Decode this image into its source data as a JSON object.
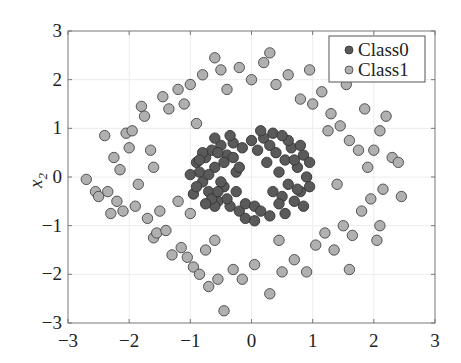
{
  "chart_data": {
    "type": "scatter",
    "title": "",
    "xlabel": "",
    "ylabel": "x2",
    "ylabel_main": "x",
    "ylabel_sub": "2",
    "xlim": [
      -3,
      3
    ],
    "ylim": [
      -3,
      3
    ],
    "xticks": [
      "−3",
      "−2",
      "−1",
      "0",
      "1",
      "2",
      "3"
    ],
    "yticks": [
      "3",
      "2",
      "1",
      "0",
      "−1",
      "−2",
      "−3"
    ],
    "grid": true,
    "legend_position": "upper right",
    "series": [
      {
        "name": "Class0",
        "color": "#5a5a5a",
        "description": "inner ring, radius ~0.5-1.0",
        "points": [
          [
            -0.9,
            0.3
          ],
          [
            -0.85,
            0.1
          ],
          [
            -0.8,
            -0.1
          ],
          [
            -0.75,
            0.4
          ],
          [
            -0.7,
            -0.3
          ],
          [
            -0.65,
            0.55
          ],
          [
            -0.6,
            0.2
          ],
          [
            -0.55,
            -0.5
          ],
          [
            -0.5,
            0.65
          ],
          [
            -0.45,
            -0.2
          ],
          [
            -0.4,
            0.45
          ],
          [
            -0.35,
            -0.6
          ],
          [
            -0.3,
            0.7
          ],
          [
            -0.25,
            0.1
          ],
          [
            -0.2,
            -0.7
          ],
          [
            -0.15,
            0.6
          ],
          [
            -0.1,
            -0.55
          ],
          [
            0.0,
            0.75
          ],
          [
            0.05,
            -0.6
          ],
          [
            0.1,
            0.55
          ],
          [
            0.15,
            -0.7
          ],
          [
            0.2,
            0.8
          ],
          [
            0.3,
            0.65
          ],
          [
            0.35,
            -0.3
          ],
          [
            0.4,
            0.5
          ],
          [
            0.45,
            0.1
          ],
          [
            0.5,
            -0.4
          ],
          [
            0.55,
            0.35
          ],
          [
            0.6,
            -0.15
          ],
          [
            0.65,
            0.6
          ],
          [
            0.7,
            -0.5
          ],
          [
            0.75,
            0.2
          ],
          [
            0.8,
            -0.3
          ],
          [
            0.85,
            0.45
          ],
          [
            0.9,
            0.0
          ],
          [
            0.95,
            -0.2
          ],
          [
            -0.95,
            -0.35
          ],
          [
            -0.8,
            0.5
          ],
          [
            -0.7,
            0.05
          ],
          [
            -0.6,
            -0.6
          ],
          [
            -0.5,
            -0.1
          ],
          [
            -0.45,
            0.3
          ],
          [
            -0.4,
            -0.45
          ],
          [
            -0.3,
            0.4
          ],
          [
            -0.25,
            -0.3
          ],
          [
            -0.2,
            0.2
          ],
          [
            0.25,
            0.3
          ],
          [
            0.35,
            0.9
          ],
          [
            0.45,
            -0.55
          ],
          [
            0.6,
            0.75
          ],
          [
            0.7,
            0.35
          ],
          [
            0.8,
            0.65
          ],
          [
            0.85,
            -0.6
          ],
          [
            -0.6,
            0.8
          ],
          [
            -0.35,
            0.85
          ],
          [
            0.5,
            0.85
          ],
          [
            0.15,
            0.95
          ],
          [
            -0.1,
            -0.85
          ],
          [
            0.3,
            -0.8
          ],
          [
            -0.55,
            0.5
          ],
          [
            -0.65,
            -0.45
          ],
          [
            -0.75,
            -0.55
          ],
          [
            -0.85,
            0.35
          ],
          [
            0.05,
            -0.9
          ],
          [
            0.55,
            -0.75
          ],
          [
            0.75,
            -0.25
          ],
          [
            0.95,
            0.3
          ],
          [
            -1.0,
            0.05
          ],
          [
            -0.9,
            -0.2
          ],
          [
            -0.55,
            -0.3
          ]
        ]
      },
      {
        "name": "Class1",
        "color": "#b0b0b0",
        "description": "outer ring, radius ~1.6-2.6",
        "points": [
          [
            -2.7,
            -0.05
          ],
          [
            -2.55,
            -0.3
          ],
          [
            -2.5,
            -0.4
          ],
          [
            -2.35,
            -0.3
          ],
          [
            -2.3,
            -0.75
          ],
          [
            -2.2,
            -0.5
          ],
          [
            -2.15,
            0.15
          ],
          [
            -2.1,
            -0.7
          ],
          [
            -2.05,
            0.9
          ],
          [
            -2.0,
            0.6
          ],
          [
            -1.95,
            0.95
          ],
          [
            -1.9,
            -0.6
          ],
          [
            -1.85,
            -0.15
          ],
          [
            -1.8,
            1.45
          ],
          [
            -1.75,
            1.25
          ],
          [
            -1.7,
            -0.85
          ],
          [
            -1.65,
            0.55
          ],
          [
            -1.6,
            -1.25
          ],
          [
            -1.55,
            -1.15
          ],
          [
            -1.5,
            -0.7
          ],
          [
            -1.45,
            1.65
          ],
          [
            -1.4,
            -1.1
          ],
          [
            -1.35,
            1.4
          ],
          [
            -1.3,
            -1.6
          ],
          [
            -1.2,
            1.8
          ],
          [
            -1.15,
            -1.45
          ],
          [
            -1.1,
            1.5
          ],
          [
            -1.05,
            -1.65
          ],
          [
            -1.0,
            1.9
          ],
          [
            -0.95,
            -1.85
          ],
          [
            -0.9,
            1.1
          ],
          [
            -0.85,
            -2.0
          ],
          [
            -0.8,
            2.1
          ],
          [
            -0.75,
            -1.5
          ],
          [
            -0.7,
            -2.25
          ],
          [
            -0.6,
            2.45
          ],
          [
            -0.55,
            -2.1
          ],
          [
            -0.5,
            2.2
          ],
          [
            -0.45,
            -2.75
          ],
          [
            -0.4,
            1.8
          ],
          [
            -0.3,
            -1.9
          ],
          [
            -0.2,
            2.25
          ],
          [
            -0.15,
            -2.1
          ],
          [
            0.0,
            2.0
          ],
          [
            0.05,
            -1.8
          ],
          [
            0.2,
            2.35
          ],
          [
            0.3,
            -2.4
          ],
          [
            0.4,
            1.9
          ],
          [
            0.5,
            -1.95
          ],
          [
            0.6,
            2.1
          ],
          [
            0.7,
            -1.7
          ],
          [
            0.8,
            1.6
          ],
          [
            0.9,
            -1.95
          ],
          [
            1.0,
            1.5
          ],
          [
            1.05,
            -1.4
          ],
          [
            1.15,
            1.75
          ],
          [
            1.2,
            -1.15
          ],
          [
            1.3,
            1.3
          ],
          [
            1.35,
            -1.5
          ],
          [
            1.45,
            1.05
          ],
          [
            1.5,
            -1.0
          ],
          [
            1.6,
            0.75
          ],
          [
            1.65,
            -1.2
          ],
          [
            1.75,
            0.55
          ],
          [
            1.8,
            -0.7
          ],
          [
            1.9,
            0.2
          ],
          [
            1.95,
            -0.45
          ],
          [
            2.0,
            0.55
          ],
          [
            2.05,
            -1.3
          ],
          [
            2.1,
            0.95
          ],
          [
            2.15,
            -0.25
          ],
          [
            2.2,
            1.25
          ],
          [
            2.3,
            0.4
          ],
          [
            2.4,
            0.3
          ],
          [
            2.45,
            -0.4
          ],
          [
            2.1,
            -1.0
          ],
          [
            1.85,
            1.4
          ],
          [
            1.55,
            1.9
          ],
          [
            0.95,
            2.2
          ],
          [
            0.3,
            2.55
          ],
          [
            -2.25,
            0.4
          ],
          [
            -2.4,
            0.85
          ],
          [
            -1.6,
            0.2
          ],
          [
            -1.2,
            -0.5
          ],
          [
            -1.0,
            -0.75
          ],
          [
            -0.6,
            -1.3
          ],
          [
            1.25,
            0.95
          ],
          [
            1.4,
            -0.15
          ],
          [
            1.6,
            -1.9
          ],
          [
            0.45,
            -1.3
          ]
        ]
      }
    ],
    "legend": [
      "Class0",
      "Class1"
    ]
  }
}
